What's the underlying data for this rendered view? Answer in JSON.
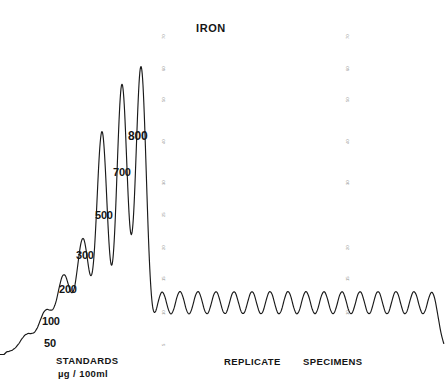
{
  "chart_data": {
    "type": "line",
    "title": "IRON",
    "xlabel": "",
    "ylabel": "",
    "grid": false,
    "legend": null,
    "annotations": [
      {
        "text": "STANDARDS",
        "x": 95,
        "y": 362
      },
      {
        "text": "µg / 100ml",
        "x": 95,
        "y": 375
      },
      {
        "text": "REPLICATE",
        "x": 258,
        "y": 363
      },
      {
        "text": "SPECIMENS",
        "x": 338,
        "y": 363
      }
    ],
    "series": [
      {
        "name": "standards",
        "unit": "µg/100ml",
        "point_labels": [
          "50",
          "100",
          "200",
          "300",
          "500",
          "700",
          "800"
        ],
        "values": [
          50,
          100,
          200,
          300,
          500,
          700,
          800
        ],
        "peak_x": [
          27,
          46,
          64,
          83,
          102,
          122,
          141
        ],
        "peak_y": [
          335,
          312,
          277,
          240,
          133,
          85,
          67
        ],
        "peak_height_px": [
          17,
          40,
          75,
          112,
          219,
          267,
          285
        ]
      },
      {
        "name": "replicate specimens",
        "count": 16,
        "values": [
          300,
          300,
          300,
          300,
          300,
          300,
          300,
          300,
          300,
          300,
          300,
          300,
          300,
          300,
          300,
          300
        ],
        "peak_x": [
          162,
          180,
          198,
          216,
          234,
          252,
          270,
          288,
          306,
          324,
          342,
          360,
          378,
          396,
          414,
          432
        ],
        "peak_y_px": 293,
        "peak_height_px": 59
      }
    ],
    "baseline_y_px": 352,
    "baseline_start_x_px": 5
  },
  "title": {
    "text": "IRON",
    "x": 196,
    "y": 22
  },
  "peak_labels": [
    {
      "text": "50",
      "x": 44,
      "y": 337,
      "size": 11
    },
    {
      "text": "100",
      "x": 42,
      "y": 315,
      "size": 11
    },
    {
      "text": "200",
      "x": 59,
      "y": 283,
      "size": 11
    },
    {
      "text": "300",
      "x": 76,
      "y": 249,
      "size": 11
    },
    {
      "text": "500",
      "x": 95,
      "y": 209,
      "size": 11
    },
    {
      "text": "700",
      "x": 113,
      "y": 166,
      "size": 11
    },
    {
      "text": "800",
      "x": 128,
      "y": 129,
      "size": 12
    }
  ],
  "captions": [
    {
      "id": "standards",
      "text": "STANDARDS",
      "x": 56,
      "y": 355,
      "size": 9.5
    },
    {
      "id": "standards-units",
      "text": "µg / 100ml",
      "x": 58,
      "y": 368,
      "size": 9.5
    },
    {
      "id": "replicate",
      "text": "REPLICATE",
      "x": 224,
      "y": 356,
      "size": 9.5
    },
    {
      "id": "specimens",
      "text": "SPECIMENS",
      "x": 303,
      "y": 356,
      "size": 9.5
    }
  ],
  "grid_number_columns": [
    {
      "id": "left-scale",
      "x": 153,
      "numbers": [
        {
          "v": "70",
          "y": 34
        },
        {
          "v": "60",
          "y": 66
        },
        {
          "v": "50",
          "y": 97
        },
        {
          "v": "40",
          "y": 139
        },
        {
          "v": "30",
          "y": 180
        },
        {
          "v": "25",
          "y": 212
        },
        {
          "v": "20",
          "y": 245
        },
        {
          "v": "15",
          "y": 276
        },
        {
          "v": "10",
          "y": 310
        },
        {
          "v": "5",
          "y": 341
        }
      ]
    },
    {
      "id": "right-scale",
      "x": 337,
      "numbers": [
        {
          "v": "70",
          "y": 34
        },
        {
          "v": "60",
          "y": 66
        },
        {
          "v": "50",
          "y": 97
        },
        {
          "v": "40",
          "y": 139
        },
        {
          "v": "30",
          "y": 180
        },
        {
          "v": "20",
          "y": 245
        },
        {
          "v": "15",
          "y": 276
        },
        {
          "v": "10",
          "y": 310
        }
      ]
    }
  ],
  "colors": {
    "trace": "#1a1a1a",
    "background": "#ffffff",
    "text": "#151515",
    "grid_number": "#8d8d8d"
  }
}
